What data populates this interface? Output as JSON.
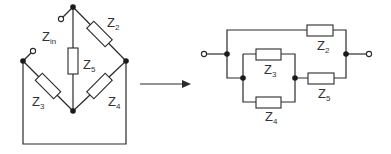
{
  "left_circuit": {
    "labels": {
      "zin": {
        "main": "Z",
        "sub": "in"
      },
      "z2": {
        "main": "Z",
        "sub": "2"
      },
      "z3": {
        "main": "Z",
        "sub": "3"
      },
      "z4": {
        "main": "Z",
        "sub": "4"
      },
      "z5": {
        "main": "Z",
        "sub": "5"
      }
    }
  },
  "right_circuit": {
    "labels": {
      "z2": {
        "main": "Z",
        "sub": "2"
      },
      "z3": {
        "main": "Z",
        "sub": "3"
      },
      "z4": {
        "main": "Z",
        "sub": "4"
      },
      "z5": {
        "main": "Z",
        "sub": "5"
      }
    }
  },
  "colors": {
    "line": "#2a2a2a",
    "node": "#1a1a1a"
  }
}
